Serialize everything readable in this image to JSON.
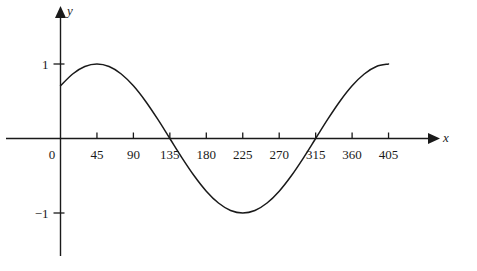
{
  "chart_data": {
    "type": "line",
    "title": "",
    "subtitle": "",
    "xlabel": "x",
    "ylabel": "y",
    "function": "y = cos(x - 45)",
    "x_unit": "degrees",
    "xlim": [
      0,
      420
    ],
    "ylim": [
      -1.45,
      1.45
    ],
    "grid": false,
    "legend": null,
    "annotations": [],
    "x_ticks": [
      {
        "value": 0,
        "label": "0"
      },
      {
        "value": 45,
        "label": "45"
      },
      {
        "value": 90,
        "label": "90"
      },
      {
        "value": 135,
        "label": "135"
      },
      {
        "value": 180,
        "label": "180"
      },
      {
        "value": 225,
        "label": "225"
      },
      {
        "value": 270,
        "label": "270"
      },
      {
        "value": 315,
        "label": "315"
      },
      {
        "value": 360,
        "label": "360"
      },
      {
        "value": 405,
        "label": "405"
      }
    ],
    "y_ticks": [
      {
        "value": 1,
        "label": "1"
      },
      {
        "value": -1,
        "label": "−1"
      }
    ],
    "series": [
      {
        "name": "y = cos(x - 45)",
        "color": "#1a1a1a",
        "x": [
          0,
          15,
          30,
          45,
          60,
          75,
          90,
          105,
          120,
          135,
          150,
          165,
          180,
          195,
          210,
          225,
          240,
          255,
          270,
          285,
          300,
          315,
          330,
          345,
          360,
          375,
          390,
          405
        ],
        "values": [
          0.707,
          0.866,
          0.966,
          1.0,
          0.966,
          0.866,
          0.707,
          0.5,
          0.259,
          0.0,
          -0.259,
          -0.5,
          -0.707,
          -0.866,
          -0.966,
          -1.0,
          -0.966,
          -0.866,
          -0.707,
          -0.5,
          -0.259,
          0.0,
          0.259,
          0.5,
          0.707,
          0.866,
          0.966,
          1.0
        ]
      }
    ],
    "key_points": {
      "start": {
        "x": 0,
        "y": 0.707
      },
      "maximum_1": {
        "x": 45,
        "y": 1
      },
      "zero_1": {
        "x": 135,
        "y": 0
      },
      "minimum": {
        "x": 225,
        "y": -1
      },
      "zero_2": {
        "x": 315,
        "y": 0
      },
      "maximum_2": {
        "x": 405,
        "y": 1
      }
    }
  },
  "axes": {
    "x_axis_label": "x",
    "y_axis_label": "y",
    "origin_label": "0"
  }
}
